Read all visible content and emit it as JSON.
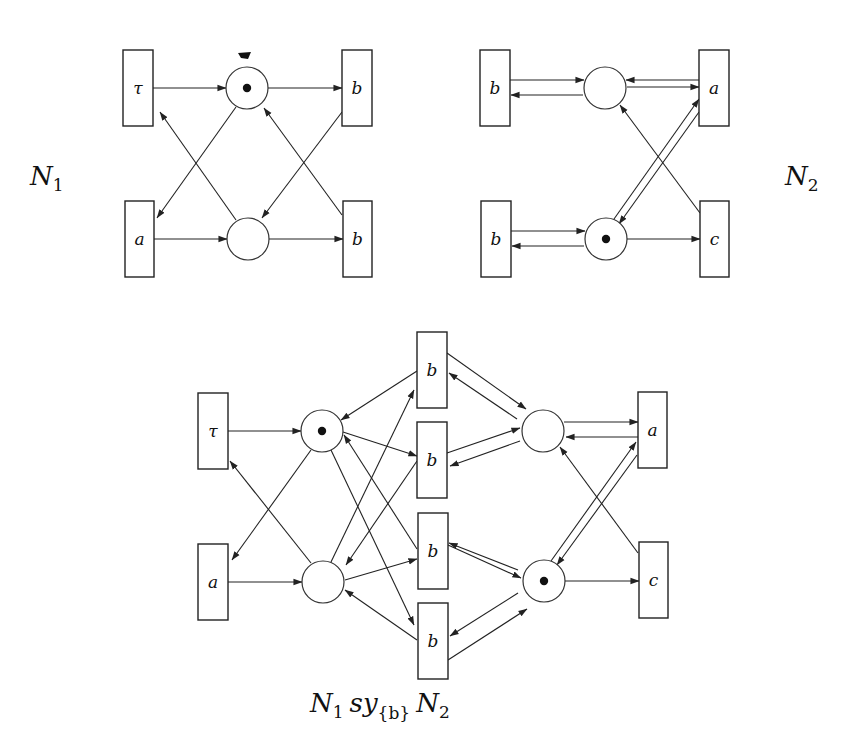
{
  "figure": {
    "nets": [
      {
        "id": "N1",
        "label": "N",
        "label_sub": "1",
        "label_pos": [
          30,
          185
        ],
        "transitions": [
          {
            "id": "n1_tau",
            "label": "τ",
            "x": 123,
            "y": 50,
            "w": 30,
            "h": 76
          },
          {
            "id": "n1_b_top",
            "label": "b",
            "x": 342,
            "y": 50,
            "w": 30,
            "h": 76
          },
          {
            "id": "n1_a",
            "label": "a",
            "x": 125,
            "y": 201,
            "w": 29,
            "h": 76
          },
          {
            "id": "n1_b_bot",
            "label": "b",
            "x": 343,
            "y": 201,
            "w": 29,
            "h": 76
          }
        ],
        "places": [
          {
            "id": "n1_p_top",
            "cx": 247,
            "cy": 88,
            "r": 21,
            "tokens": 1
          },
          {
            "id": "n1_p_bot",
            "cx": 248,
            "cy": 239,
            "r": 21,
            "tokens": 0
          }
        ],
        "arcs": [
          {
            "from": [
              153,
              88
            ],
            "to": [
              226,
              88
            ]
          },
          {
            "from": [
              268,
              88
            ],
            "to": [
              342,
              88
            ]
          },
          {
            "from": [
              154,
              239
            ],
            "to": [
              227,
              239
            ]
          },
          {
            "from": [
              269,
              239
            ],
            "to": [
              343,
              239
            ]
          },
          {
            "from": [
              236,
              107
            ],
            "to": [
              157,
              218
            ]
          },
          {
            "from": [
              236,
              220
            ],
            "to": [
              160,
              112
            ]
          },
          {
            "from": [
              342,
              112
            ],
            "to": [
              262,
              218
            ]
          },
          {
            "from": [
              342,
              215
            ],
            "to": [
              264,
              108
            ]
          }
        ],
        "blot": {
          "x": 245,
          "y": 56
        }
      },
      {
        "id": "N2",
        "label": "N",
        "label_sub": "2",
        "label_pos": [
          785,
          185
        ],
        "transitions": [
          {
            "id": "n2_b_top",
            "label": "b",
            "x": 480,
            "y": 50,
            "w": 30,
            "h": 76
          },
          {
            "id": "n2_a",
            "label": "a",
            "x": 699,
            "y": 50,
            "w": 30,
            "h": 76
          },
          {
            "id": "n2_b_bot",
            "label": "b",
            "x": 481,
            "y": 201,
            "w": 30,
            "h": 76
          },
          {
            "id": "n2_c",
            "label": "c",
            "x": 700,
            "y": 201,
            "w": 29,
            "h": 76
          }
        ],
        "places": [
          {
            "id": "n2_p_top",
            "cx": 605,
            "cy": 88,
            "r": 21,
            "tokens": 0
          },
          {
            "id": "n2_p_bot",
            "cx": 606,
            "cy": 239,
            "r": 21,
            "tokens": 1
          }
        ],
        "arcs": [
          {
            "from": [
              510,
              80
            ],
            "to": [
              584,
              80
            ]
          },
          {
            "from": [
              583,
              95
            ],
            "to": [
              511,
              95
            ]
          },
          {
            "from": [
              699,
              80
            ],
            "to": [
              626,
              80
            ]
          },
          {
            "from": [
              627,
              87
            ],
            "to": [
              699,
              87
            ]
          },
          {
            "from": [
              511,
              231
            ],
            "to": [
              585,
              231
            ]
          },
          {
            "from": [
              584,
              246
            ],
            "to": [
              512,
              246
            ]
          },
          {
            "from": [
              627,
              239
            ],
            "to": [
              700,
              239
            ]
          },
          {
            "from": [
              614,
              219
            ],
            "to": [
              699,
              99
            ]
          },
          {
            "from": [
              699,
              112
            ],
            "to": [
              619,
              224
            ]
          },
          {
            "from": [
              700,
              213
            ],
            "to": [
              620,
              105
            ]
          }
        ]
      },
      {
        "id": "N1_sy_N2",
        "label": "N",
        "label_sub": "1",
        "label_mid": "sy",
        "label_mid_sub": "{b}",
        "label_end": "N",
        "label_end_sub": "2",
        "label_pos": [
          310,
          712
        ],
        "transitions": [
          {
            "id": "s_tau",
            "label": "τ",
            "x": 198,
            "y": 393,
            "w": 30,
            "h": 76
          },
          {
            "id": "s_a_left",
            "label": "a",
            "x": 198,
            "y": 544,
            "w": 30,
            "h": 76
          },
          {
            "id": "s_b1",
            "label": "b",
            "x": 417,
            "y": 332,
            "w": 30,
            "h": 76
          },
          {
            "id": "s_b2",
            "label": "b",
            "x": 417,
            "y": 422,
            "w": 30,
            "h": 76
          },
          {
            "id": "s_b3",
            "label": "b",
            "x": 418,
            "y": 513,
            "w": 30,
            "h": 76
          },
          {
            "id": "s_b4",
            "label": "b",
            "x": 418,
            "y": 603,
            "w": 30,
            "h": 76
          },
          {
            "id": "s_a_right",
            "label": "a",
            "x": 638,
            "y": 392,
            "w": 29,
            "h": 76
          },
          {
            "id": "s_c",
            "label": "c",
            "x": 639,
            "y": 542,
            "w": 29,
            "h": 76
          }
        ],
        "places": [
          {
            "id": "s_p_lt",
            "cx": 322,
            "cy": 431,
            "r": 21,
            "tokens": 1
          },
          {
            "id": "s_p_lb",
            "cx": 323,
            "cy": 582,
            "r": 21,
            "tokens": 0
          },
          {
            "id": "s_p_rt",
            "cx": 543,
            "cy": 431,
            "r": 21,
            "tokens": 0
          },
          {
            "id": "s_p_rb",
            "cx": 544,
            "cy": 581,
            "r": 21,
            "tokens": 1
          }
        ],
        "arcs": [
          {
            "from": [
              228,
              431
            ],
            "to": [
              301,
              431
            ]
          },
          {
            "from": [
              228,
              582
            ],
            "to": [
              302,
              582
            ]
          },
          {
            "from": [
              311,
              450
            ],
            "to": [
              232,
              560
            ]
          },
          {
            "from": [
              311,
              563
            ],
            "to": [
              230,
              461
            ]
          },
          {
            "from": [
              417,
              371
            ],
            "to": [
              341,
              420
            ]
          },
          {
            "from": [
              343,
              432
            ],
            "to": [
              417,
              456
            ]
          },
          {
            "from": [
              417,
              549
            ],
            "to": [
              344,
              435
            ]
          },
          {
            "from": [
              417,
              640
            ],
            "to": [
              345,
              590
            ]
          },
          {
            "from": [
              331,
              562
            ],
            "to": [
              414,
              390
            ]
          },
          {
            "from": [
              417,
              461
            ],
            "to": [
              346,
              565
            ]
          },
          {
            "from": [
              345,
              580
            ],
            "to": [
              417,
              559
            ]
          },
          {
            "from": [
              331,
              450
            ],
            "to": [
              414,
              625
            ]
          },
          {
            "from": [
              447,
              353
            ],
            "to": [
              526,
              409
            ]
          },
          {
            "from": [
              517,
              419
            ],
            "to": [
              449,
              373
            ]
          },
          {
            "from": [
              447,
              453
            ],
            "to": [
              520,
              428
            ]
          },
          {
            "from": [
              520,
              441
            ],
            "to": [
              450,
              466
            ]
          },
          {
            "from": [
              448,
              545
            ],
            "to": [
              521,
              578
            ]
          },
          {
            "from": [
              518,
              570
            ],
            "to": [
              449,
              543
            ]
          },
          {
            "from": [
              518,
              593
            ],
            "to": [
              450,
              636
            ]
          },
          {
            "from": [
              448,
              660
            ],
            "to": [
              527,
              609
            ]
          },
          {
            "from": [
              564,
              422
            ],
            "to": [
              638,
              422
            ]
          },
          {
            "from": [
              638,
              437
            ],
            "to": [
              566,
              437
            ]
          },
          {
            "from": [
              565,
              581
            ],
            "to": [
              639,
              581
            ]
          },
          {
            "from": [
              551,
              561
            ],
            "to": [
              636,
              442
            ]
          },
          {
            "from": [
              637,
              455
            ],
            "to": [
              557,
              565
            ]
          },
          {
            "from": [
              638,
              553
            ],
            "to": [
              560,
              447
            ]
          }
        ]
      }
    ]
  }
}
